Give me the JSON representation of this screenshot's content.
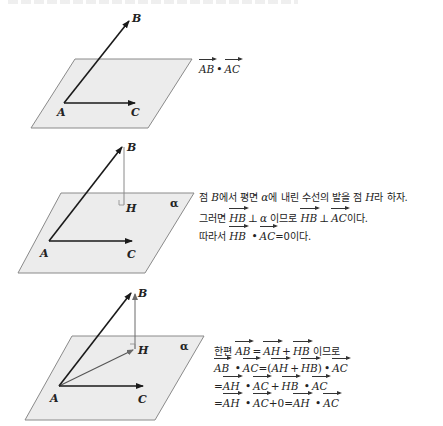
{
  "figures": [
    {
      "id": "fig1",
      "labels": {
        "A": "A",
        "B": "B",
        "C": "C"
      },
      "caption": {
        "lhs": "AB",
        "op": "•",
        "rhs": "AC"
      }
    },
    {
      "id": "fig2",
      "labels": {
        "A": "A",
        "B": "B",
        "C": "C",
        "H": "H",
        "plane": "α"
      },
      "lines": [
        {
          "pre": "점 ",
          "var": "B",
          "post": "에서 평면 ",
          "plane": "α",
          "post2": "에 내린 수선의 발을 점 ",
          "var2": "H",
          "post3": "라 하자."
        },
        {
          "pre": "그러면 ",
          "v1": "HB",
          "perp1": "⊥",
          "plane": "α",
          "mid": " 이므로 ",
          "v2": "HB",
          "perp2": "⊥",
          "v3": "AC",
          "post": "이다."
        },
        {
          "pre": "따라서 ",
          "v1": "HB",
          "op": "•",
          "v2": "AC",
          "post": "=0이다."
        }
      ]
    },
    {
      "id": "fig3",
      "labels": {
        "A": "A",
        "B": "B",
        "C": "C",
        "H": "H",
        "plane": "α"
      },
      "lines": [
        {
          "pre": "한편 ",
          "v1": "AB",
          "eq": "=",
          "v2": "AH",
          "plus": "+",
          "v3": "HB",
          "post": " 이므로"
        },
        {
          "v1": "AB",
          "op1": "•",
          "v2": "AC",
          "eq": "=(",
          "v3": "AH",
          "plus": "+",
          "v4": "HB",
          "close": ")",
          "op2": "•",
          "v5": "AC"
        },
        {
          "eq": "=",
          "v1": "AH",
          "op1": "•",
          "v2": "AC",
          "plus": "+",
          "v3": "HB",
          "op2": "•",
          "v4": "AC"
        },
        {
          "eq": "=",
          "v1": "AH",
          "op1": "•",
          "v2": "AC",
          "plus0": "+0=",
          "v3": "AH",
          "op2": "•",
          "v4": "AC"
        }
      ]
    }
  ],
  "colors": {
    "plane_fill": "#ececec",
    "plane_edge": "#8a8a8a",
    "vector": "#1a1a1a",
    "perp_line": "#8a8a8a"
  }
}
